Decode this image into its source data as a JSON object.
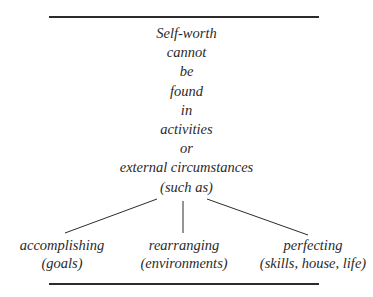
{
  "diagram": {
    "stem_lines": [
      "Self-worth",
      "cannot",
      "be",
      "found",
      "in",
      "activities",
      "or",
      "external circumstances",
      "(such as)"
    ],
    "branches": [
      {
        "label": "accomplishing",
        "detail": "(goals)"
      },
      {
        "label": "rearranging",
        "detail": "(environments)"
      },
      {
        "label": "perfecting",
        "detail": "(skills, house, life)"
      }
    ],
    "colors": {
      "text": "#2a2a2a",
      "lines": "#2b2b2b",
      "background": "#ffffff"
    }
  }
}
